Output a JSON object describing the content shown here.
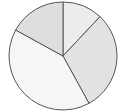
{
  "chart_data": {
    "type": "pie",
    "title": "",
    "categories": [
      "Slice A",
      "Slice B",
      "Slice C",
      "Slice D"
    ],
    "values": [
      12,
      30,
      41,
      17
    ],
    "colors": [
      "#ececec",
      "#e2e2e2",
      "#f6f6f6",
      "#dedede"
    ],
    "start_angle_deg": 0,
    "direction": "clockwise",
    "legend": "none",
    "labels_shown": false
  },
  "style": {
    "stroke": "#555555",
    "center": [
      63,
      56
    ],
    "radius": 54
  }
}
